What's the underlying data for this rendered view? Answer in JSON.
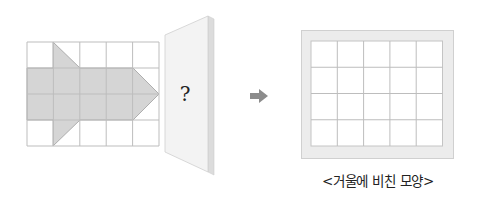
{
  "source_grid": {
    "cols": 5,
    "rows": 4,
    "shape": "arrow-pointing-right",
    "fill_color": "#d5d5d5",
    "grid_color": "#bdbdbd"
  },
  "mirror": {
    "label": "?",
    "face_color": "#f3f3f3",
    "edge_color": "#dcdcdc"
  },
  "arrow": {
    "icon": "right-arrow-icon",
    "color": "#8c8c8c"
  },
  "result_frame": {
    "cols": 5,
    "rows": 4,
    "frame_color": "#ececec",
    "caption": "<거울에 비친 모양>"
  }
}
